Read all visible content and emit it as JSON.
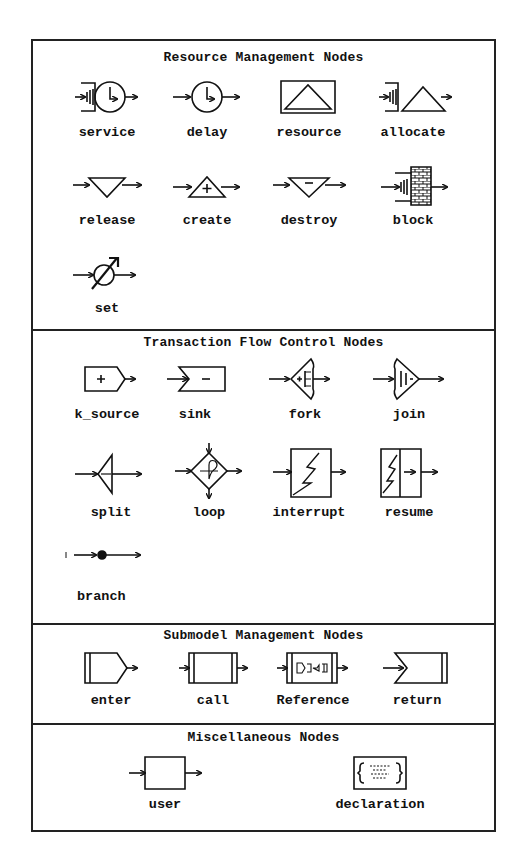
{
  "sections": [
    {
      "title": "Resource Management Nodes",
      "nodes": [
        {
          "label": "service",
          "icon": "service-icon"
        },
        {
          "label": "delay",
          "icon": "delay-icon"
        },
        {
          "label": "resource",
          "icon": "resource-icon"
        },
        {
          "label": "allocate",
          "icon": "allocate-icon"
        },
        {
          "label": "release",
          "icon": "release-icon"
        },
        {
          "label": "create",
          "icon": "create-icon"
        },
        {
          "label": "destroy",
          "icon": "destroy-icon"
        },
        {
          "label": "block",
          "icon": "block-icon"
        },
        {
          "label": "set",
          "icon": "set-icon"
        }
      ]
    },
    {
      "title": "Transaction Flow Control Nodes",
      "nodes": [
        {
          "label": "k_source",
          "icon": "source-icon"
        },
        {
          "label": "sink",
          "icon": "sink-icon"
        },
        {
          "label": "fork",
          "icon": "fork-icon"
        },
        {
          "label": "join",
          "icon": "join-icon"
        },
        {
          "label": "split",
          "icon": "split-icon"
        },
        {
          "label": "loop",
          "icon": "loop-icon"
        },
        {
          "label": "interrupt",
          "icon": "interrupt-icon"
        },
        {
          "label": "resume",
          "icon": "resume-icon"
        },
        {
          "label": "branch",
          "icon": "branch-icon"
        }
      ]
    },
    {
      "title": "Submodel Management Nodes",
      "nodes": [
        {
          "label": "enter",
          "icon": "enter-icon"
        },
        {
          "label": "call",
          "icon": "call-icon"
        },
        {
          "label": "Reference",
          "icon": "reference-icon"
        },
        {
          "label": "return",
          "icon": "return-icon"
        }
      ]
    },
    {
      "title": "Miscellaneous Nodes",
      "nodes": [
        {
          "label": "user",
          "icon": "user-icon"
        },
        {
          "label": "declaration",
          "icon": "declaration-icon"
        }
      ]
    }
  ],
  "colors": {
    "ink": "#111111",
    "background": "#ffffff"
  }
}
